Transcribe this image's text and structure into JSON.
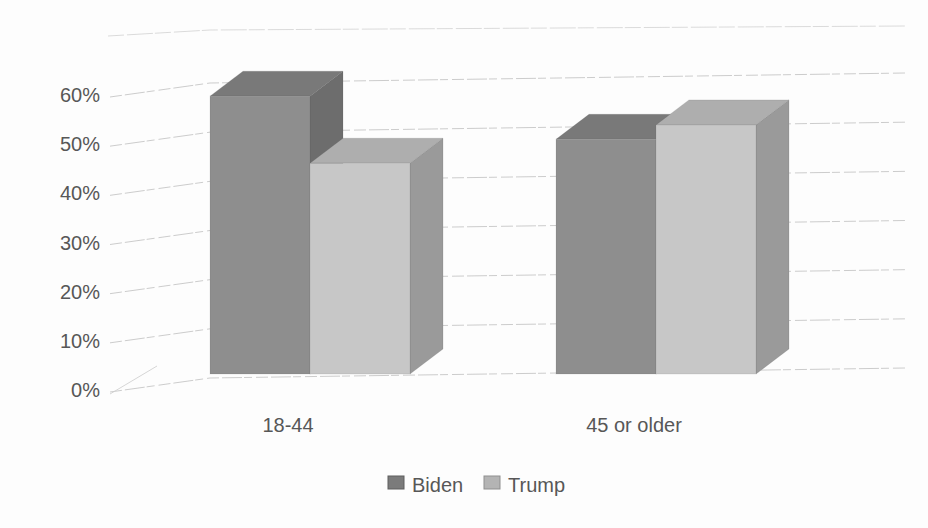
{
  "page": {
    "background": "#fdfdfd"
  },
  "chart_data": {
    "type": "bar",
    "variant": "3d-clustered-column",
    "title": "",
    "xlabel": "",
    "ylabel": "",
    "categories": [
      "18-44",
      "45 or older"
    ],
    "series": [
      {
        "name": "Biden",
        "values": [
          58,
          49
        ],
        "front": "#8e8e8e",
        "top": "#797979",
        "side": "#6d6d6d",
        "swatch": "#7b7b7b",
        "swatch_border": "#5e5e5e"
      },
      {
        "name": "Trump",
        "values": [
          44,
          52
        ],
        "front": "#c7c7c7",
        "top": "#aeaeae",
        "side": "#9a9a9a",
        "swatch": "#b4b4b4",
        "swatch_border": "#8f8f8f"
      }
    ],
    "y_ticks": [
      {
        "label": "0%",
        "value": 0
      },
      {
        "label": "10%",
        "value": 10
      },
      {
        "label": "20%",
        "value": 20
      },
      {
        "label": "30%",
        "value": 30
      },
      {
        "label": "40%",
        "value": 40
      },
      {
        "label": "50%",
        "value": 50
      },
      {
        "label": "60%",
        "value": 60
      }
    ],
    "ylim": [
      0,
      60
    ],
    "grid": true,
    "legend_position": "bottom",
    "colors": {
      "gridline": "#c6c6c6",
      "wall_edge": "#cfcfcf",
      "text": "#575757"
    }
  }
}
